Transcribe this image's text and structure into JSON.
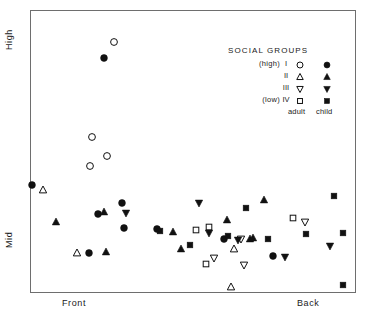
{
  "axes": {
    "y_top_label": "High",
    "y_bottom_label": "Mid",
    "x_left_label": "Front",
    "x_right_label": "Back"
  },
  "legend": {
    "title": "SOCIAL GROUPS",
    "rows": [
      {
        "side": "(high)",
        "group": "I",
        "adult_marker": "open-circle",
        "child_marker": "filled-circle"
      },
      {
        "side": "",
        "group": "II",
        "adult_marker": "open-triangle-up",
        "child_marker": "filled-triangle-up"
      },
      {
        "side": "",
        "group": "III",
        "adult_marker": "open-triangle-down",
        "child_marker": "filled-triangle-down"
      },
      {
        "side": "(low)",
        "group": "IV",
        "adult_marker": "open-square",
        "child_marker": "filled-square"
      }
    ],
    "adult_column_label": "adult",
    "child_column_label": "child"
  },
  "colors": {
    "marker": "#111111",
    "frame": "#6e6e6e",
    "background": "#ffffff",
    "text": "#1a1a1a"
  },
  "chart_data": {
    "type": "scatter",
    "title": "",
    "xlabel": "",
    "ylabel": "",
    "xlim": [
      30,
      356
    ],
    "ylim": [
      293,
      10
    ],
    "x_tick_labels": [
      "Front",
      "Back"
    ],
    "y_tick_labels": [
      "High",
      "Mid"
    ],
    "grid": false,
    "legend_position": "top-right",
    "series": [
      {
        "name": "I adult",
        "marker": "open-circle",
        "points": [
          [
            114,
            42
          ],
          [
            92,
            137
          ],
          [
            107,
            156
          ],
          [
            90,
            166
          ]
        ]
      },
      {
        "name": "I child",
        "marker": "filled-circle",
        "points": [
          [
            104,
            58
          ],
          [
            32,
            185
          ],
          [
            122,
            203
          ],
          [
            98,
            214
          ],
          [
            124,
            228
          ],
          [
            157,
            229
          ],
          [
            89,
            253
          ],
          [
            224,
            239
          ],
          [
            273,
            256
          ]
        ]
      },
      {
        "name": "II adult",
        "marker": "open-triangle-up",
        "points": [
          [
            43,
            190
          ],
          [
            77,
            253
          ],
          [
            234,
            249
          ],
          [
            231,
            287
          ]
        ]
      },
      {
        "name": "II child",
        "marker": "filled-triangle-up",
        "points": [
          [
            56,
            222
          ],
          [
            104,
            212
          ],
          [
            106,
            252
          ],
          [
            173,
            232
          ],
          [
            181,
            249
          ],
          [
            227,
            220
          ],
          [
            250,
            239
          ],
          [
            253,
            238
          ],
          [
            264,
            200
          ]
        ]
      },
      {
        "name": "III adult",
        "marker": "open-triangle-down",
        "points": [
          [
            214,
            258
          ],
          [
            241,
            239
          ],
          [
            244,
            265
          ],
          [
            305,
            222
          ]
        ]
      },
      {
        "name": "III child",
        "marker": "filled-triangle-down",
        "points": [
          [
            126,
            213
          ],
          [
            199,
            203
          ],
          [
            209,
            233
          ],
          [
            238,
            240
          ],
          [
            285,
            257
          ],
          [
            330,
            246
          ]
        ]
      },
      {
        "name": "IV adult",
        "marker": "open-square",
        "points": [
          [
            196,
            230
          ],
          [
            209,
            227
          ],
          [
            206,
            264
          ],
          [
            293,
            218
          ]
        ]
      },
      {
        "name": "IV child",
        "marker": "filled-square",
        "points": [
          [
            160,
            231
          ],
          [
            190,
            245
          ],
          [
            228,
            236
          ],
          [
            246,
            208
          ],
          [
            268,
            239
          ],
          [
            306,
            234
          ],
          [
            334,
            196
          ],
          [
            343,
            233
          ],
          [
            343,
            285
          ]
        ]
      }
    ]
  }
}
